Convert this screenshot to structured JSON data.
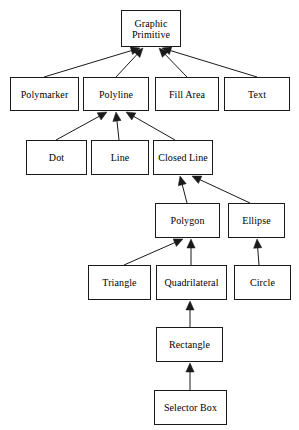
{
  "diagram": {
    "type": "inheritance-hierarchy",
    "background_color": "#ffffff",
    "line_color": "#1a1a1a",
    "text_color": "#000000",
    "arrow_style": "solid-filled-triangle-pointing-to-parent",
    "nodes": [
      {
        "id": "graphic-primitive",
        "label": "Graphic\nPrimitive",
        "x": 121,
        "y": 10,
        "w": 60,
        "h": 37
      },
      {
        "id": "polymarker",
        "label": "Polymarker",
        "x": 10,
        "y": 77,
        "w": 69,
        "h": 34
      },
      {
        "id": "polyline",
        "label": "Polyline",
        "x": 83,
        "y": 77,
        "w": 66,
        "h": 34
      },
      {
        "id": "fill-area",
        "label": "Fill Area",
        "x": 155,
        "y": 77,
        "w": 64,
        "h": 34
      },
      {
        "id": "text",
        "label": "Text",
        "x": 224,
        "y": 77,
        "w": 66,
        "h": 34
      },
      {
        "id": "dot",
        "label": "Dot",
        "x": 26,
        "y": 140,
        "w": 61,
        "h": 35
      },
      {
        "id": "line",
        "label": "Line",
        "x": 91,
        "y": 140,
        "w": 58,
        "h": 35
      },
      {
        "id": "closed-line",
        "label": "Closed Line",
        "x": 153,
        "y": 140,
        "w": 60,
        "h": 35
      },
      {
        "id": "polygon",
        "label": "Polygon",
        "x": 155,
        "y": 203,
        "w": 65,
        "h": 35
      },
      {
        "id": "ellipse",
        "label": "Ellipse",
        "x": 228,
        "y": 203,
        "w": 57,
        "h": 35
      },
      {
        "id": "triangle",
        "label": "Triangle",
        "x": 88,
        "y": 265,
        "w": 63,
        "h": 35
      },
      {
        "id": "quadrilateral",
        "label": "Quadrilateral",
        "x": 156,
        "y": 265,
        "w": 71,
        "h": 35
      },
      {
        "id": "circle",
        "label": "Circle",
        "x": 234,
        "y": 265,
        "w": 57,
        "h": 35
      },
      {
        "id": "rectangle",
        "label": "Rectangle",
        "x": 156,
        "y": 327,
        "w": 67,
        "h": 35
      },
      {
        "id": "selector-box",
        "label": "Selector Box",
        "x": 154,
        "y": 390,
        "w": 73,
        "h": 35
      }
    ],
    "edges": [
      {
        "from": "polymarker",
        "to": "graphic-primitive",
        "x1": 44,
        "y1": 77,
        "x2": 140,
        "y2": 48
      },
      {
        "from": "polyline",
        "to": "graphic-primitive",
        "x1": 116,
        "y1": 77,
        "x2": 143,
        "y2": 48
      },
      {
        "from": "fill-area",
        "to": "graphic-primitive",
        "x1": 187,
        "y1": 77,
        "x2": 159,
        "y2": 48
      },
      {
        "from": "text",
        "to": "graphic-primitive",
        "x1": 257,
        "y1": 77,
        "x2": 162,
        "y2": 48
      },
      {
        "from": "dot",
        "to": "polyline",
        "x1": 56,
        "y1": 140,
        "x2": 107,
        "y2": 112
      },
      {
        "from": "line",
        "to": "polyline",
        "x1": 119,
        "y1": 140,
        "x2": 116,
        "y2": 112
      },
      {
        "from": "closed-line",
        "to": "polyline",
        "x1": 175,
        "y1": 140,
        "x2": 126,
        "y2": 112
      },
      {
        "from": "polygon",
        "to": "closed-line",
        "x1": 187,
        "y1": 203,
        "x2": 180,
        "y2": 176
      },
      {
        "from": "ellipse",
        "to": "closed-line",
        "x1": 250,
        "y1": 203,
        "x2": 192,
        "y2": 176
      },
      {
        "from": "triangle",
        "to": "polygon",
        "x1": 124,
        "y1": 265,
        "x2": 183,
        "y2": 239
      },
      {
        "from": "quadrilateral",
        "to": "polygon",
        "x1": 191,
        "y1": 265,
        "x2": 191,
        "y2": 239
      },
      {
        "from": "circle",
        "to": "ellipse",
        "x1": 259,
        "y1": 265,
        "x2": 257,
        "y2": 239
      },
      {
        "from": "rectangle",
        "to": "quadrilateral",
        "x1": 190,
        "y1": 327,
        "x2": 190,
        "y2": 301
      },
      {
        "from": "selector-box",
        "to": "rectangle",
        "x1": 190,
        "y1": 390,
        "x2": 190,
        "y2": 363
      }
    ]
  }
}
